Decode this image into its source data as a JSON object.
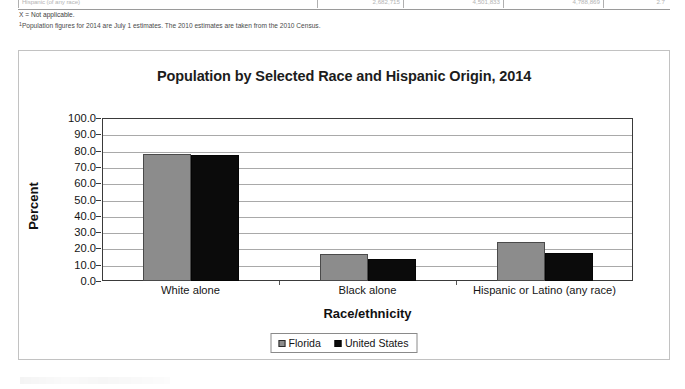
{
  "table_fragment": {
    "row_label": "Hispanic (of any race)",
    "dots": "..................................................................",
    "cells": [
      "2,682,715",
      "4,501,833",
      "4,788,869",
      "2.7"
    ]
  },
  "footnotes": [
    {
      "marker": "",
      "text": "X = Not applicable."
    },
    {
      "marker": "1",
      "text": "Population figures for 2014 are July 1 estimates. The 2010 estimates are taken from the 2010 Census."
    }
  ],
  "chart": {
    "title": "Population by Selected Race and Hispanic Origin, 2014",
    "y_axis_title": "Percent",
    "x_axis_title": "Race/ethnicity",
    "legend": {
      "position": "bottom-center",
      "entries": [
        {
          "label": "Florida",
          "color": "#8c8c8c",
          "swatch": "florida-swatch"
        },
        {
          "label": "United States",
          "color": "#0b0b0b",
          "swatch": "united-states-swatch"
        }
      ]
    }
  },
  "chart_data": {
    "type": "bar",
    "title": "Population by Selected Race and Hispanic Origin, 2014",
    "xlabel": "Race/ethnicity",
    "ylabel": "Percent",
    "ylim": [
      0,
      100
    ],
    "ytick_step": 10,
    "ytick_labels": [
      "0.0",
      "10.0",
      "20.0",
      "30.0",
      "40.0",
      "50.0",
      "60.0",
      "70.0",
      "80.0",
      "90.0",
      "100.0"
    ],
    "grid": true,
    "grid_axis": "y",
    "legend_position": "bottom-center",
    "categories": [
      "White alone",
      "Black alone",
      "Hispanic or Latino (any race)"
    ],
    "series": [
      {
        "name": "Florida",
        "color": "#8c8c8c",
        "values": [
          78.1,
          16.8,
          24.1
        ]
      },
      {
        "name": "United States",
        "color": "#0b0b0b",
        "values": [
          77.4,
          13.2,
          17.4
        ]
      }
    ]
  }
}
